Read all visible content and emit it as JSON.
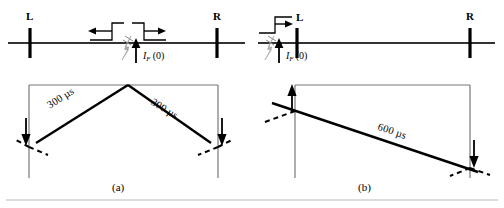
{
  "figure": {
    "stroke_color": "#000000",
    "thin_stroke_color": "#555555",
    "fault_symbol_color": "#9a9a9a",
    "background": "#ffffff"
  },
  "panels": [
    {
      "id": "a",
      "caption": "(a)",
      "description": "Fault at mid-line; waves travel 300 microseconds to each terminal",
      "line_diagram": {
        "left_bus_label": "L",
        "right_bus_label": "R",
        "fault_current_label_italic": "I",
        "fault_current_subscript": "F",
        "fault_current_argument": "(0)",
        "fault_current_label_full": "I_F (0)",
        "wave_arrows": [
          {
            "name": "left-traveling-wave-arrow",
            "direction": "left"
          },
          {
            "name": "right-traveling-wave-arrow",
            "direction": "right"
          }
        ]
      },
      "lattice": {
        "travel_times": [
          "300 µs",
          "300 µs"
        ],
        "apex_label": "",
        "terminal_arrows": [
          {
            "name": "left-terminal-arrow",
            "direction": "down"
          },
          {
            "name": "right-terminal-arrow",
            "direction": "down"
          }
        ]
      }
    },
    {
      "id": "b",
      "caption": "(b)",
      "description": "Fault at bus L; wave travels 600 microseconds to the remote terminal",
      "line_diagram": {
        "left_bus_label": "L",
        "right_bus_label": "R",
        "fault_current_label_italic": "I",
        "fault_current_subscript": "F",
        "fault_current_argument": "(0)",
        "fault_current_label_full": "I_F (0)",
        "wave_arrows": [
          {
            "name": "right-traveling-wave-arrow",
            "direction": "right"
          }
        ]
      },
      "lattice": {
        "travel_times": [
          "600 µs"
        ],
        "terminal_arrows": [
          {
            "name": "left-terminal-arrow",
            "direction": "up"
          },
          {
            "name": "right-terminal-arrow",
            "direction": "down"
          }
        ]
      }
    }
  ]
}
